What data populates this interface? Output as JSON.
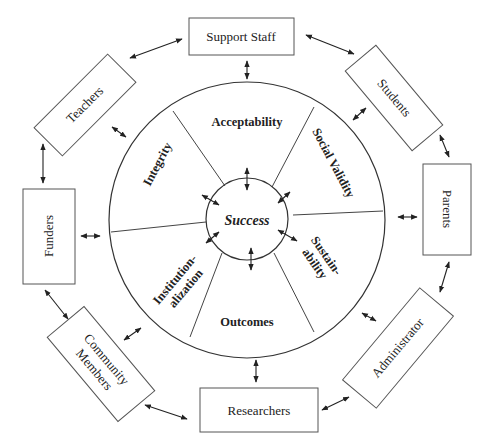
{
  "diagram": {
    "center": {
      "label": "Success"
    },
    "segments": [
      {
        "label": "Acceptability"
      },
      {
        "label": "Social Validity"
      },
      {
        "label": "Sustain-",
        "label2": "ability"
      },
      {
        "label": "Outcomes"
      },
      {
        "label": "Institution-",
        "label2": "alization"
      },
      {
        "label": "Integrity"
      }
    ],
    "stakeholders": [
      {
        "label": "Support Staff"
      },
      {
        "label": "Students"
      },
      {
        "label": "Parents"
      },
      {
        "label": "Administrator"
      },
      {
        "label": "Researchers"
      },
      {
        "label": "Community",
        "label2": "Members"
      },
      {
        "label": "Funders"
      },
      {
        "label": "Teachers"
      }
    ],
    "colors": {
      "line": "#333333",
      "text": "#222222",
      "background": "#ffffff"
    }
  }
}
